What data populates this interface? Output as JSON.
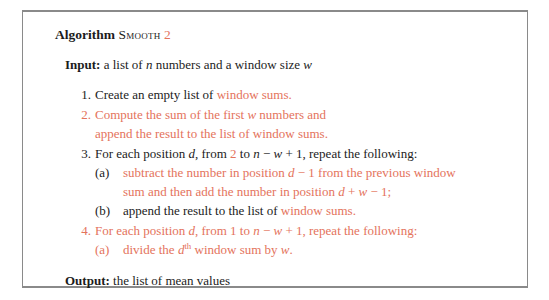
{
  "document": {
    "type": "algorithm-pseudocode-figure",
    "accent_color": "#e4735c",
    "text_color": "#1c1c1c",
    "border_color": "#8a8a8a",
    "background": "#ffffff"
  },
  "heading": {
    "keyword": "Algorithm",
    "name": "Smooth",
    "version": "2"
  },
  "input": {
    "label": "Input:",
    "text_a": "a list of",
    "var_n": "n",
    "text_b": "numbers and a window size",
    "var_w": "w"
  },
  "steps": [
    {
      "num": "1.",
      "num_color": "black",
      "lines": [
        {
          "segments": [
            {
              "text": "Create an empty list of ",
              "color": "black"
            },
            {
              "text": "window sums.",
              "color": "orange"
            }
          ]
        }
      ]
    },
    {
      "num": "2.",
      "num_color": "orange",
      "lines": [
        {
          "segments": [
            {
              "text": "Compute the sum of the first ",
              "color": "orange"
            },
            {
              "text": "w",
              "color": "orange",
              "style": "italic"
            },
            {
              "text": " numbers and",
              "color": "orange"
            }
          ]
        },
        {
          "segments": [
            {
              "text": "append the result to the list of window sums.",
              "color": "orange"
            }
          ]
        }
      ]
    },
    {
      "num": "3.",
      "num_color": "black",
      "lines": [
        {
          "segments": [
            {
              "text": "For each position ",
              "color": "black"
            },
            {
              "text": "d",
              "color": "black",
              "style": "italic"
            },
            {
              "text": ", from ",
              "color": "black"
            },
            {
              "text": "2",
              "color": "orange"
            },
            {
              "text": " to ",
              "color": "black"
            },
            {
              "text": "n",
              "color": "black",
              "style": "italic"
            },
            {
              "text": " − ",
              "color": "black"
            },
            {
              "text": "w",
              "color": "black",
              "style": "italic"
            },
            {
              "text": " + 1, repeat the following:",
              "color": "black"
            }
          ]
        }
      ],
      "substeps": [
        {
          "letter": "(a)",
          "letter_color": "black",
          "lines": [
            {
              "segments": [
                {
                  "text": "subtract the number in position ",
                  "color": "orange"
                },
                {
                  "text": "d",
                  "color": "orange",
                  "style": "italic"
                },
                {
                  "text": " − 1 from the previous window",
                  "color": "orange"
                }
              ]
            },
            {
              "segments": [
                {
                  "text": "sum and then add the number in position ",
                  "color": "orange"
                },
                {
                  "text": "d",
                  "color": "orange",
                  "style": "italic"
                },
                {
                  "text": " + ",
                  "color": "orange"
                },
                {
                  "text": "w",
                  "color": "orange",
                  "style": "italic"
                },
                {
                  "text": " − 1;",
                  "color": "orange"
                }
              ]
            }
          ]
        },
        {
          "letter": "(b)",
          "letter_color": "black",
          "lines": [
            {
              "segments": [
                {
                  "text": "append the result to the list of ",
                  "color": "black"
                },
                {
                  "text": "window sums.",
                  "color": "orange"
                }
              ]
            }
          ]
        }
      ]
    },
    {
      "num": "4.",
      "num_color": "orange",
      "lines": [
        {
          "segments": [
            {
              "text": "For each position ",
              "color": "orange"
            },
            {
              "text": "d",
              "color": "orange",
              "style": "italic"
            },
            {
              "text": ", from 1 to ",
              "color": "orange"
            },
            {
              "text": "n",
              "color": "orange",
              "style": "italic"
            },
            {
              "text": " − ",
              "color": "orange"
            },
            {
              "text": "w",
              "color": "orange",
              "style": "italic"
            },
            {
              "text": " + 1, repeat the following:",
              "color": "orange"
            }
          ]
        }
      ],
      "substeps": [
        {
          "letter": "(a)",
          "letter_color": "orange",
          "lines": [
            {
              "segments": [
                {
                  "text": "divide the ",
                  "color": "orange"
                },
                {
                  "text": "d",
                  "color": "orange",
                  "style": "italic"
                },
                {
                  "text": "th",
                  "color": "orange",
                  "sup": true
                },
                {
                  "text": " window sum by ",
                  "color": "orange"
                },
                {
                  "text": "w",
                  "color": "orange",
                  "style": "italic"
                },
                {
                  "text": ".",
                  "color": "orange"
                }
              ]
            }
          ]
        }
      ]
    }
  ],
  "output": {
    "label": "Output:",
    "text": "the list of mean values"
  }
}
